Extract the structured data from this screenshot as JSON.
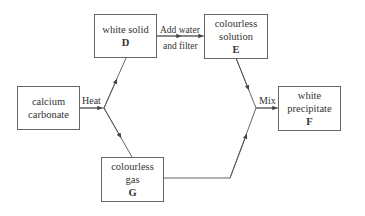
{
  "diagram": {
    "type": "chemistry-flowchart",
    "nodes": {
      "calcium_carbonate": {
        "line1": "calcium",
        "line2": "carbonate"
      },
      "D": {
        "line1": "white solid",
        "letter": "D"
      },
      "E": {
        "line1": "colourless",
        "line2": "solution",
        "letter": "E"
      },
      "F": {
        "line1": "white",
        "line2": "precipitate",
        "letter": "F"
      },
      "G": {
        "line1": "colourless",
        "line2": "gas",
        "letter": "G"
      }
    },
    "edges": [
      {
        "from": "calcium_carbonate",
        "to": "D",
        "label": "Heat"
      },
      {
        "from": "calcium_carbonate",
        "to": "G",
        "label": "Heat"
      },
      {
        "from": "D",
        "to": "E",
        "label": "Add water and filter"
      },
      {
        "from": "E",
        "to": "F",
        "label": "Mix"
      },
      {
        "from": "G",
        "to": "F",
        "label": "Mix"
      }
    ],
    "labels": {
      "heat": "Heat",
      "add_water": "Add water",
      "and_filter": "and filter",
      "mix": "Mix"
    }
  }
}
